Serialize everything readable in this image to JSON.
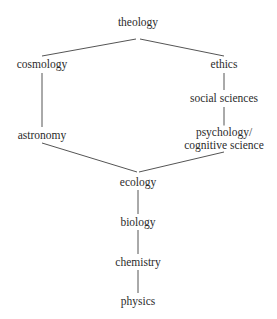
{
  "diagram": {
    "type": "hierarchy-tree",
    "title": "",
    "background_color": "#ffffff",
    "text_color": "#2b2b2b",
    "edge_color": "#555555",
    "nodes": [
      {
        "id": "theology",
        "label": "theology",
        "lines": [
          "theology"
        ],
        "x": 138,
        "y": 22
      },
      {
        "id": "cosmology",
        "label": "cosmology",
        "lines": [
          "cosmology"
        ],
        "x": 42,
        "y": 64
      },
      {
        "id": "ethics",
        "label": "ethics",
        "lines": [
          "ethics"
        ],
        "x": 224,
        "y": 64
      },
      {
        "id": "social-sciences",
        "label": "social sciences",
        "lines": [
          "social sciences"
        ],
        "x": 224,
        "y": 98
      },
      {
        "id": "astronomy",
        "label": "astronomy",
        "lines": [
          "astronomy"
        ],
        "x": 42,
        "y": 135
      },
      {
        "id": "psychology",
        "label": "psychology/ cognitive science",
        "lines": [
          "psychology/",
          "cognitive science"
        ],
        "x": 224,
        "y": 138
      },
      {
        "id": "ecology",
        "label": "ecology",
        "lines": [
          "ecology"
        ],
        "x": 138,
        "y": 182
      },
      {
        "id": "biology",
        "label": "biology",
        "lines": [
          "biology"
        ],
        "x": 138,
        "y": 222
      },
      {
        "id": "chemistry",
        "label": "chemistry",
        "lines": [
          "chemistry"
        ],
        "x": 138,
        "y": 262
      },
      {
        "id": "physics",
        "label": "physics",
        "lines": [
          "physics"
        ],
        "x": 138,
        "y": 301
      }
    ],
    "edges": [
      {
        "id": "theology-cosmology",
        "from": "theology",
        "to": "cosmology",
        "x1": 136,
        "y1": 39,
        "x2": 42,
        "y2": 56
      },
      {
        "id": "theology-ethics",
        "from": "theology",
        "to": "ethics",
        "x1": 140,
        "y1": 39,
        "x2": 224,
        "y2": 56
      },
      {
        "id": "cosmology-astronomy",
        "from": "cosmology",
        "to": "astronomy",
        "x1": 42,
        "y1": 73,
        "x2": 42,
        "y2": 127
      },
      {
        "id": "ethics-social-sciences",
        "from": "ethics",
        "to": "social sciences",
        "x1": 224,
        "y1": 73,
        "x2": 224,
        "y2": 90
      },
      {
        "id": "social-sciences-psychology",
        "from": "social sciences",
        "to": "psychology",
        "x1": 224,
        "y1": 107,
        "x2": 224,
        "y2": 126
      },
      {
        "id": "astronomy-ecology",
        "from": "astronomy",
        "to": "ecology",
        "x1": 42,
        "y1": 143,
        "x2": 137,
        "y2": 172
      },
      {
        "id": "psychology-ecology",
        "from": "psychology",
        "to": "ecology",
        "x1": 224,
        "y1": 152,
        "x2": 139,
        "y2": 172
      },
      {
        "id": "ecology-biology",
        "from": "ecology",
        "to": "biology",
        "x1": 138,
        "y1": 190,
        "x2": 138,
        "y2": 214
      },
      {
        "id": "biology-chemistry",
        "from": "biology",
        "to": "chemistry",
        "x1": 138,
        "y1": 230,
        "x2": 138,
        "y2": 254
      },
      {
        "id": "chemistry-physics",
        "from": "chemistry",
        "to": "physics",
        "x1": 138,
        "y1": 270,
        "x2": 138,
        "y2": 293
      }
    ]
  }
}
